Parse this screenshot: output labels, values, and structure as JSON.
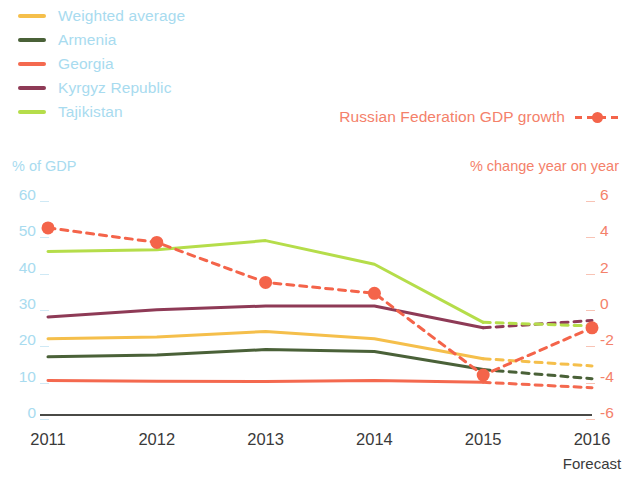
{
  "legend_left": {
    "items": [
      {
        "label": "Weighted average",
        "color": "#f5bf4b",
        "key": "weighted_average"
      },
      {
        "label": "Armenia",
        "color": "#4a6138",
        "key": "armenia"
      },
      {
        "label": "Georgia",
        "color": "#f4694f",
        "key": "georgia"
      },
      {
        "label": "Kyrgyz Republic",
        "color": "#8e3a56",
        "key": "kyrgyz_republic"
      },
      {
        "label": "Tajikistan",
        "color": "#b5dd4a",
        "key": "tajikistan"
      }
    ],
    "label_color": "#a8dbef"
  },
  "legend_right": {
    "label": "Russian Federation GDP growth",
    "color": "#f4644a",
    "style": "dashed-with-markers"
  },
  "axes": {
    "left_title": "% of GDP",
    "left_title_color": "#a8dbef",
    "right_title": "% change year on year",
    "right_title_color": "#f4816a",
    "left_ticks": [
      "60",
      "50",
      "40",
      "30",
      "20",
      "10",
      "0"
    ],
    "right_ticks": [
      "6",
      "4",
      "2",
      "0",
      "-2",
      "-4",
      "-6"
    ],
    "x_ticks": [
      "2011",
      "2012",
      "2013",
      "2014",
      "2015",
      "2016"
    ],
    "forecast_note": "Forecast"
  },
  "chart_data": {
    "type": "line",
    "title": "",
    "subtitle": "",
    "xlabel": "",
    "ylabel": "% of GDP",
    "y2label": "% change year on year",
    "x": [
      "2011",
      "2012",
      "2013",
      "2014",
      "2015",
      "2016"
    ],
    "ylim": [
      0,
      60
    ],
    "y2lim": [
      -6,
      6
    ],
    "grid": false,
    "legend_position": "top-left",
    "forecast_from": "2015",
    "forecast_note": "Forecast",
    "series": [
      {
        "name": "Weighted average",
        "axis": "left",
        "color": "#f5bf4b",
        "values": [
          21.0,
          21.5,
          23.0,
          21.0,
          15.5,
          13.5
        ]
      },
      {
        "name": "Armenia",
        "axis": "left",
        "color": "#4a6138",
        "values": [
          16.0,
          16.5,
          18.0,
          17.5,
          12.5,
          10.0
        ]
      },
      {
        "name": "Georgia",
        "axis": "left",
        "color": "#f4694f",
        "values": [
          9.5,
          9.3,
          9.2,
          9.5,
          9.0,
          7.5
        ]
      },
      {
        "name": "Kyrgyz Republic",
        "axis": "left",
        "color": "#8e3a56",
        "values": [
          27.0,
          29.0,
          30.0,
          30.0,
          24.0,
          26.0
        ]
      },
      {
        "name": "Tajikistan",
        "axis": "left",
        "color": "#b5dd4a",
        "values": [
          45.0,
          45.5,
          48.0,
          41.5,
          25.5,
          24.5
        ]
      },
      {
        "name": "Russian Federation GDP growth",
        "axis": "right",
        "color": "#f4644a",
        "style": "dashed",
        "markers": true,
        "values": [
          4.3,
          3.5,
          1.3,
          0.7,
          -3.8,
          -1.2
        ]
      }
    ]
  }
}
